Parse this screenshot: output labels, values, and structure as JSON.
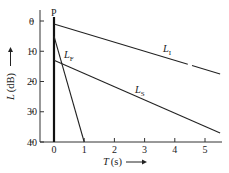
{
  "chart_data": {
    "type": "line",
    "title": "",
    "xlabel": "T (s)",
    "ylabel": "L (dB)",
    "xlim": [
      -0.4,
      5.5
    ],
    "ylim": [
      -40,
      2
    ],
    "xticks": [
      0,
      1,
      2,
      3,
      4,
      5
    ],
    "yticks": [
      0,
      -10,
      -20,
      -30,
      -40
    ],
    "xtick_labels": [
      "0",
      "1",
      "2",
      "3",
      "4",
      "5"
    ],
    "ytick_labels": [
      "0",
      "−10",
      "−20",
      "−30",
      "−40"
    ],
    "grid": false,
    "legend": "inline labels",
    "annotations": [
      {
        "text": "P",
        "x": 0,
        "y": 2
      }
    ],
    "series": [
      {
        "name": "P",
        "label": "P",
        "x": [
          0,
          0
        ],
        "y": [
          0,
          -40
        ],
        "style": "bold vertical"
      },
      {
        "name": "L_I",
        "label_main": "L",
        "label_sub": "I",
        "x": [
          0,
          5.5
        ],
        "y": [
          -1,
          -17.5
        ],
        "gap_near_x": 4.5
      },
      {
        "name": "L_S",
        "label_main": "L",
        "label_sub": "S",
        "x": [
          0,
          5.5
        ],
        "y": [
          -13,
          -37
        ]
      },
      {
        "name": "L_F",
        "label_main": "L",
        "label_sub": "F",
        "x": [
          0,
          1
        ],
        "y": [
          -5,
          -40
        ]
      }
    ]
  },
  "axes": {
    "x_label_main": "T",
    "x_label_unit": "(s)",
    "y_label_main": "L",
    "y_label_unit": "(dB)"
  }
}
